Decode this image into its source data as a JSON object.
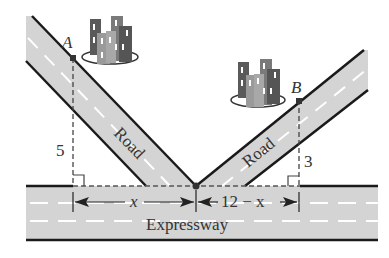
{
  "diagram": {
    "points": {
      "A": {
        "label": "A"
      },
      "B": {
        "label": "B"
      }
    },
    "roads": {
      "left_label": "Road",
      "right_label": "Road",
      "expressway_label": "Expressway"
    },
    "distances": {
      "A_height": "5",
      "B_height": "3",
      "left_segment": "x",
      "right_segment": "12 − x"
    },
    "colors": {
      "road_fill": "#d4d4d4",
      "road_edge": "#1a1a1a",
      "lane_dash": "#ffffff",
      "building_dark": "#5a5a5a",
      "building_mid": "#8a8a8a",
      "building_light": "#a8a8a8"
    }
  }
}
